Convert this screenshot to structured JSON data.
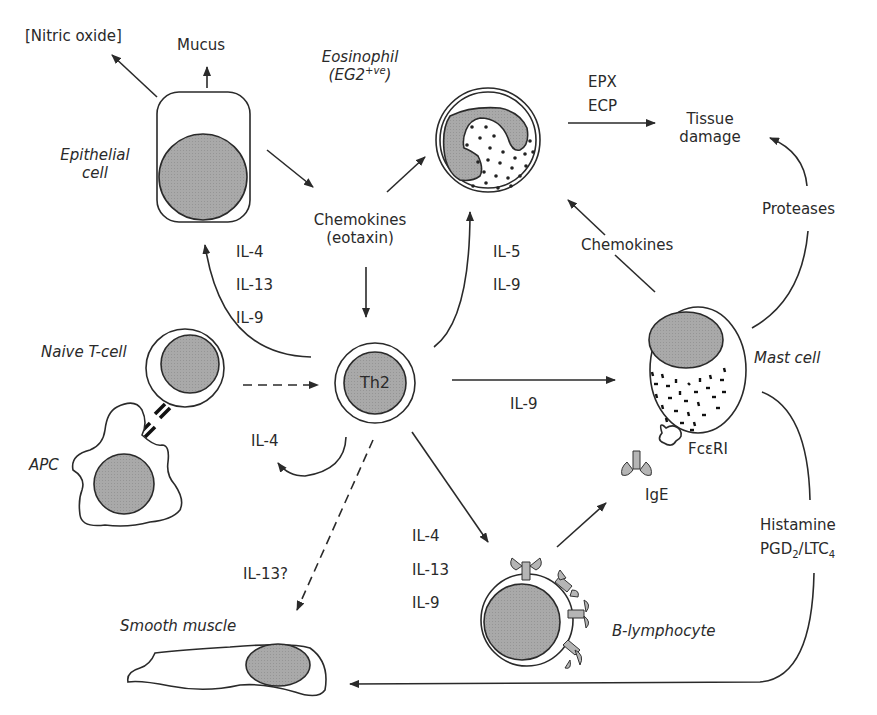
{
  "diagram": {
    "cells": {
      "epithelial": {
        "label_line1": "Epithelial",
        "label_line2": "cell"
      },
      "eosinophil": {
        "label_line1": "Eosinophil",
        "label_line2_base": "(EG2",
        "label_line2_sup": "+ve",
        "label_line2_end": ")"
      },
      "naive_t_cell": {
        "label": "Naive T-cell"
      },
      "apc": {
        "label": "APC"
      },
      "th2": {
        "label": "Th2"
      },
      "mast_cell": {
        "label": "Mast cell"
      },
      "b_lymphocyte": {
        "label": "B-lymphocyte"
      },
      "smooth_muscle": {
        "label": "Smooth muscle"
      }
    },
    "products": {
      "nitric_oxide": "[Nitric oxide]",
      "mucus": "Mucus",
      "tissue_damage_line1": "Tissue",
      "tissue_damage_line2": "damage",
      "epx": "EPX",
      "ecp": "ECP",
      "proteases": "Proteases",
      "chemokines_mast": "Chemokines",
      "chemokines_eotaxin_line1": "Chemokines",
      "chemokines_eotaxin_line2": "(eotaxin)",
      "fceri": "FcεRI",
      "ige": "IgE",
      "histamine": "Histamine",
      "pgd_ltc": {
        "pgd": "PGD",
        "pgd_sub": "2",
        "sep": "/LTC",
        "ltc_sub": "4"
      }
    },
    "cytokines": {
      "to_epithelial": [
        "IL-4",
        "IL-13",
        "IL-9"
      ],
      "to_eosinophil": [
        "IL-5",
        "IL-9"
      ],
      "to_mast": "IL-9",
      "autocrine": "IL-4",
      "to_smooth_muscle": "IL-13?",
      "to_b_cell": [
        "IL-4",
        "IL-13",
        "IL-9"
      ]
    },
    "colors": {
      "nucleus_fill": "#a8a8a8",
      "line": "#2a2a2a",
      "background": "#ffffff"
    }
  }
}
